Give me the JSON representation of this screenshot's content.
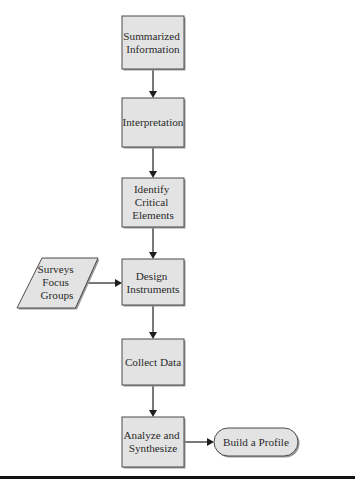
{
  "diagram": {
    "type": "flowchart",
    "colors": {
      "node_fill": "#e3e3e3",
      "node_stroke": "#4a4a4a",
      "edge": "#1e1e1e",
      "background": "#ffffff"
    },
    "nodes": [
      {
        "id": "summarized",
        "shape": "rectangle",
        "lines": [
          "Summarized",
          "Information"
        ]
      },
      {
        "id": "interpretation",
        "shape": "rectangle",
        "lines": [
          "Interpretation"
        ]
      },
      {
        "id": "identify",
        "shape": "rectangle",
        "lines": [
          "Identify",
          "Critical",
          "Elements"
        ]
      },
      {
        "id": "design",
        "shape": "rectangle",
        "lines": [
          "Design",
          "Instruments"
        ]
      },
      {
        "id": "collect",
        "shape": "rectangle",
        "lines": [
          "Collect Data"
        ]
      },
      {
        "id": "analyze",
        "shape": "rectangle",
        "lines": [
          "Analyze and",
          "Synthesize"
        ]
      },
      {
        "id": "surveys",
        "shape": "parallelogram",
        "lines": [
          "Surveys",
          "Focus",
          "Groups"
        ]
      },
      {
        "id": "profile",
        "shape": "terminal",
        "lines": [
          "Build a Profile"
        ]
      }
    ],
    "edges": [
      {
        "from": "summarized",
        "to": "interpretation"
      },
      {
        "from": "interpretation",
        "to": "identify"
      },
      {
        "from": "identify",
        "to": "design"
      },
      {
        "from": "surveys",
        "to": "design"
      },
      {
        "from": "design",
        "to": "collect"
      },
      {
        "from": "collect",
        "to": "analyze"
      },
      {
        "from": "analyze",
        "to": "profile"
      }
    ]
  }
}
